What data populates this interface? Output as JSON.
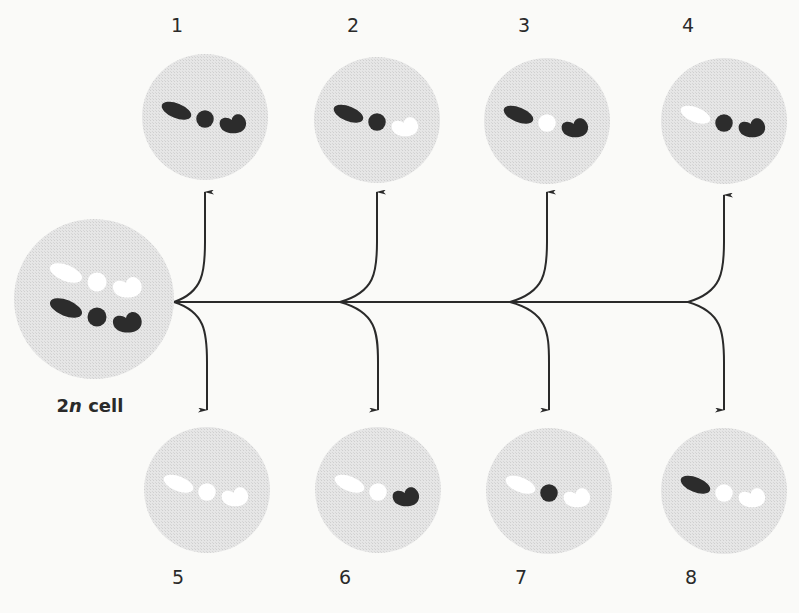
{
  "diagram": {
    "colors": {
      "background": "#fafaf8",
      "cell_fill": "#e4e4e4",
      "cell_stipple": "#d4d4d4",
      "dark_chromosome": "#2c2c2c",
      "light_chromosome": "#ffffff",
      "arrow": "#2a2a2a",
      "label": "#2a2a2a"
    },
    "parent_cell": {
      "label_prefix": "2",
      "label_italic": "n",
      "label_suffix": " cell",
      "center": [
        94,
        299
      ],
      "radius": 80
    },
    "gametes": [
      {
        "number": "1",
        "center": [
          205,
          117
        ],
        "label_pos": [
          177,
          25
        ],
        "chromosomes": {
          "rod": "dark",
          "round": "dark",
          "hook": "dark"
        }
      },
      {
        "number": "2",
        "center": [
          377,
          120
        ],
        "label_pos": [
          353,
          25
        ],
        "chromosomes": {
          "rod": "dark",
          "round": "dark",
          "hook": "light"
        }
      },
      {
        "number": "3",
        "center": [
          547,
          121
        ],
        "label_pos": [
          524,
          25
        ],
        "chromosomes": {
          "rod": "dark",
          "round": "light",
          "hook": "dark"
        }
      },
      {
        "number": "4",
        "center": [
          724,
          121
        ],
        "label_pos": [
          688,
          25
        ],
        "chromosomes": {
          "rod": "light",
          "round": "dark",
          "hook": "dark"
        }
      },
      {
        "number": "5",
        "center": [
          207,
          490
        ],
        "label_pos": [
          178,
          577
        ],
        "chromosomes": {
          "rod": "light",
          "round": "light",
          "hook": "light"
        }
      },
      {
        "number": "6",
        "center": [
          378,
          490
        ],
        "label_pos": [
          345,
          577
        ],
        "chromosomes": {
          "rod": "light",
          "round": "light",
          "hook": "dark"
        }
      },
      {
        "number": "7",
        "center": [
          549,
          491
        ],
        "label_pos": [
          521,
          577
        ],
        "chromosomes": {
          "rod": "light",
          "round": "dark",
          "hook": "light"
        }
      },
      {
        "number": "8",
        "center": [
          724,
          491
        ],
        "label_pos": [
          691,
          577
        ],
        "chromosomes": {
          "rod": "dark",
          "round": "light",
          "hook": "light"
        }
      }
    ],
    "trunk": {
      "y": 302,
      "x_start": 174,
      "x_end": 688
    },
    "branch_points": [
      {
        "x": 174,
        "up_to": [
          205,
          192
        ],
        "down_to": [
          207,
          410
        ]
      },
      {
        "x": 340,
        "up_to": [
          377,
          192
        ],
        "down_to": [
          378,
          410
        ]
      },
      {
        "x": 510,
        "up_to": [
          547,
          192
        ],
        "down_to": [
          549,
          410
        ]
      },
      {
        "x": 688,
        "up_to": [
          724,
          195
        ],
        "down_to": [
          724,
          410
        ]
      }
    ],
    "cell_radius": 63
  }
}
